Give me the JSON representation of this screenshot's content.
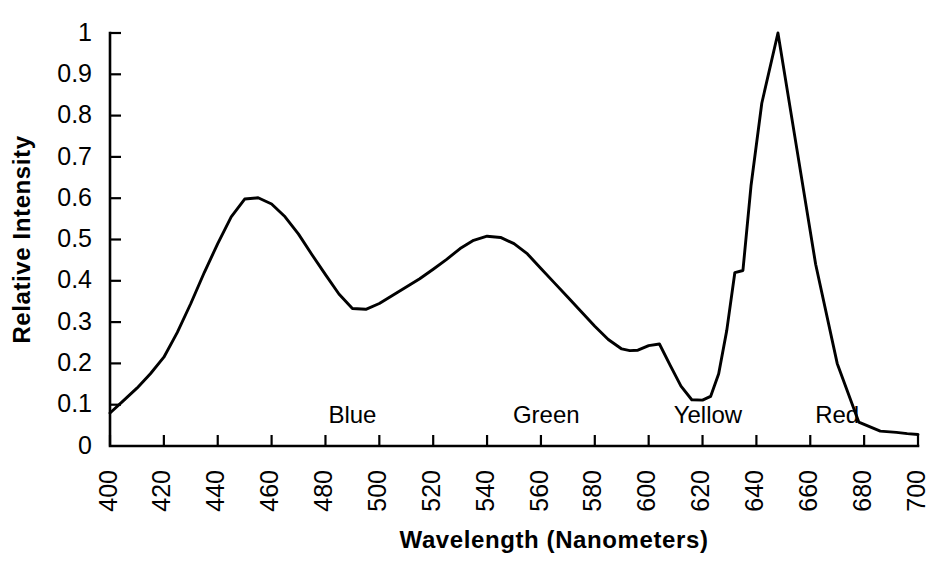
{
  "chart_data": {
    "type": "line",
    "title": "",
    "subtitle": "",
    "xlabel": "Wavelength  (Nanometers)",
    "ylabel": "Relative Intensity",
    "xlim": [
      400,
      700
    ],
    "ylim": [
      0,
      1
    ],
    "grid": false,
    "legend": "none",
    "x_ticks": [
      400,
      420,
      440,
      460,
      480,
      500,
      520,
      540,
      560,
      580,
      600,
      620,
      640,
      660,
      680,
      700
    ],
    "x_tick_labels": [
      "400",
      "420",
      "440",
      "460",
      "480",
      "500",
      "520",
      "540",
      "560",
      "580",
      "600",
      "620",
      "640",
      "660",
      "680",
      "700"
    ],
    "y_ticks": [
      0,
      0.1,
      0.2,
      0.3,
      0.4,
      0.5,
      0.6,
      0.7,
      0.8,
      0.9,
      1
    ],
    "y_tick_labels": [
      "0",
      "0.1",
      "0.2",
      "0.3",
      "0.4",
      "0.5",
      "0.6",
      "0.7",
      "0.8",
      "0.9",
      "1"
    ],
    "series": [
      {
        "name": "Relative Intensity",
        "color": "#000000",
        "x": [
          400,
          405,
          410,
          415,
          420,
          425,
          430,
          435,
          440,
          445,
          450,
          455,
          460,
          465,
          470,
          475,
          480,
          485,
          490,
          495,
          500,
          505,
          510,
          515,
          520,
          525,
          530,
          535,
          540,
          545,
          550,
          555,
          560,
          565,
          570,
          575,
          580,
          585,
          590,
          593,
          596,
          600,
          604,
          608,
          612,
          616,
          620,
          623,
          626,
          629,
          632,
          635,
          638,
          642,
          648,
          655,
          662,
          670,
          678,
          686,
          692,
          696,
          700
        ],
        "y": [
          0.08,
          0.11,
          0.14,
          0.175,
          0.215,
          0.275,
          0.345,
          0.42,
          0.49,
          0.555,
          0.598,
          0.601,
          0.586,
          0.555,
          0.513,
          0.463,
          0.415,
          0.368,
          0.333,
          0.331,
          0.345,
          0.365,
          0.385,
          0.405,
          0.428,
          0.452,
          0.478,
          0.498,
          0.508,
          0.505,
          0.49,
          0.465,
          0.43,
          0.395,
          0.36,
          0.325,
          0.29,
          0.258,
          0.235,
          0.231,
          0.232,
          0.243,
          0.247,
          0.195,
          0.145,
          0.112,
          0.111,
          0.12,
          0.175,
          0.28,
          0.42,
          0.425,
          0.63,
          0.83,
          1.0,
          0.72,
          0.44,
          0.2,
          0.058,
          0.036,
          0.033,
          0.03,
          0.028
        ]
      }
    ],
    "band_annotations": [
      {
        "label": "Blue",
        "x": 490,
        "y": 0.055
      },
      {
        "label": "Green",
        "x": 562,
        "y": 0.055
      },
      {
        "label": "Yellow",
        "x": 622,
        "y": 0.055
      },
      {
        "label": "Red",
        "x": 670,
        "y": 0.055
      }
    ]
  }
}
